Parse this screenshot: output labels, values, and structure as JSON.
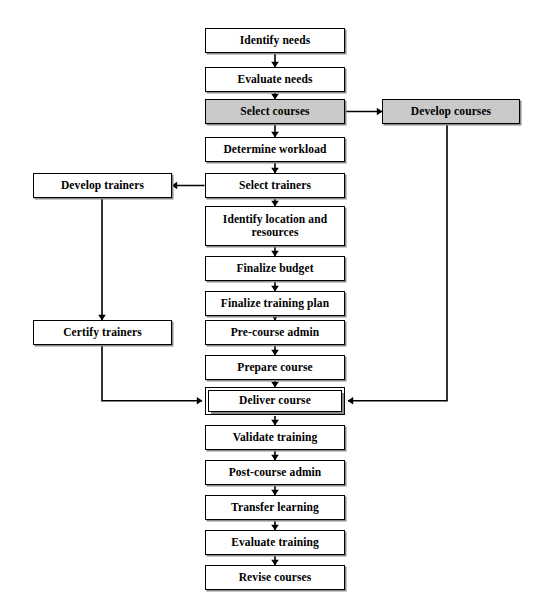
{
  "diagram": {
    "colors": {
      "line": "#000000",
      "node_fill": "#ffffff",
      "shaded_fill": "#c9c9c9",
      "shadow": "#8a8a8a",
      "background": "#ffffff"
    },
    "nodes": [
      {
        "id": "identify-needs",
        "label": "Identify needs",
        "x": 205,
        "y": 28,
        "w": 140,
        "h": 25,
        "style": "plain"
      },
      {
        "id": "evaluate-needs",
        "label": "Evaluate needs",
        "x": 205,
        "y": 67,
        "w": 140,
        "h": 25,
        "style": "plain"
      },
      {
        "id": "select-courses",
        "label": "Select courses",
        "x": 205,
        "y": 99,
        "w": 140,
        "h": 25,
        "style": "shaded"
      },
      {
        "id": "develop-courses",
        "label": "Develop courses",
        "x": 382,
        "y": 99,
        "w": 138,
        "h": 25,
        "style": "shaded"
      },
      {
        "id": "determine-workload",
        "label": "Determine workload",
        "x": 205,
        "y": 137,
        "w": 140,
        "h": 25,
        "style": "plain"
      },
      {
        "id": "select-trainers",
        "label": "Select trainers",
        "x": 205,
        "y": 173,
        "w": 140,
        "h": 25,
        "style": "plain"
      },
      {
        "id": "develop-trainers",
        "label": "Develop trainers",
        "x": 33,
        "y": 173,
        "w": 139,
        "h": 25,
        "style": "plain"
      },
      {
        "id": "identify-location",
        "label": "Identify location and resources",
        "x": 205,
        "y": 206,
        "w": 140,
        "h": 40,
        "style": "plain"
      },
      {
        "id": "finalize-budget",
        "label": "Finalize budget",
        "x": 205,
        "y": 256,
        "w": 140,
        "h": 25,
        "style": "plain"
      },
      {
        "id": "finalize-training-plan",
        "label": "Finalize training plan",
        "x": 205,
        "y": 291,
        "w": 140,
        "h": 25,
        "style": "plain"
      },
      {
        "id": "certify-trainers",
        "label": "Certify trainers",
        "x": 33,
        "y": 320,
        "w": 139,
        "h": 25,
        "style": "plain"
      },
      {
        "id": "pre-course-admin",
        "label": "Pre-course admin",
        "x": 205,
        "y": 320,
        "w": 140,
        "h": 25,
        "style": "plain"
      },
      {
        "id": "prepare-course",
        "label": "Prepare course",
        "x": 205,
        "y": 355,
        "w": 140,
        "h": 25,
        "style": "plain"
      },
      {
        "id": "deliver-course",
        "label": "Deliver course",
        "x": 208,
        "y": 390,
        "w": 134,
        "h": 22,
        "style": "emphasis"
      },
      {
        "id": "validate-training",
        "label": "Validate training",
        "x": 205,
        "y": 425,
        "w": 140,
        "h": 25,
        "style": "plain"
      },
      {
        "id": "post-course-admin",
        "label": "Post-course admin",
        "x": 205,
        "y": 460,
        "w": 140,
        "h": 25,
        "style": "plain"
      },
      {
        "id": "transfer-learning",
        "label": "Transfer learning",
        "x": 205,
        "y": 495,
        "w": 140,
        "h": 25,
        "style": "plain"
      },
      {
        "id": "evaluate-training",
        "label": "Evaluate training",
        "x": 205,
        "y": 530,
        "w": 140,
        "h": 25,
        "style": "plain"
      },
      {
        "id": "revise-courses",
        "label": "Revise courses",
        "x": 205,
        "y": 565,
        "w": 140,
        "h": 25,
        "style": "plain"
      }
    ],
    "connectors": [
      {
        "id": "identify-to-evaluate",
        "from": "identify-needs",
        "to": "evaluate-needs",
        "kind": "vertical-arrow"
      },
      {
        "id": "evaluate-to-select-courses",
        "from": "evaluate-needs",
        "to": "select-courses",
        "kind": "vertical-arrow"
      },
      {
        "id": "select-courses-to-develop",
        "from": "select-courses",
        "to": "develop-courses",
        "kind": "horizontal-arrow-right"
      },
      {
        "id": "select-courses-to-workload",
        "from": "select-courses",
        "to": "determine-workload",
        "kind": "vertical-arrow"
      },
      {
        "id": "workload-to-select-trainers",
        "from": "determine-workload",
        "to": "select-trainers",
        "kind": "vertical-arrow"
      },
      {
        "id": "select-trainers-to-develop",
        "from": "select-trainers",
        "to": "develop-trainers",
        "kind": "horizontal-arrow-left"
      },
      {
        "id": "select-trainers-to-location",
        "from": "select-trainers",
        "to": "identify-location",
        "kind": "vertical-arrow"
      },
      {
        "id": "location-to-budget",
        "from": "identify-location",
        "to": "finalize-budget",
        "kind": "vertical-arrow"
      },
      {
        "id": "budget-to-plan",
        "from": "finalize-budget",
        "to": "finalize-training-plan",
        "kind": "vertical-arrow"
      },
      {
        "id": "plan-to-precourse",
        "from": "finalize-training-plan",
        "to": "pre-course-admin",
        "kind": "vertical-arrow"
      },
      {
        "id": "develop-trainers-to-certify",
        "from": "develop-trainers",
        "to": "certify-trainers",
        "kind": "vertical-arrow"
      },
      {
        "id": "precourse-to-prepare",
        "from": "pre-course-admin",
        "to": "prepare-course",
        "kind": "vertical-arrow"
      },
      {
        "id": "prepare-to-deliver",
        "from": "prepare-course",
        "to": "deliver-course",
        "kind": "vertical-arrow"
      },
      {
        "id": "certify-to-deliver",
        "from": "certify-trainers",
        "to": "deliver-course",
        "kind": "elbow-right"
      },
      {
        "id": "develop-courses-to-deliver",
        "from": "develop-courses",
        "to": "deliver-course",
        "kind": "elbow-left"
      },
      {
        "id": "deliver-to-validate",
        "from": "deliver-course",
        "to": "validate-training",
        "kind": "vertical-arrow"
      },
      {
        "id": "validate-to-postcourse",
        "from": "validate-training",
        "to": "post-course-admin",
        "kind": "vertical-arrow"
      },
      {
        "id": "postcourse-to-transfer",
        "from": "post-course-admin",
        "to": "transfer-learning",
        "kind": "vertical-arrow"
      },
      {
        "id": "transfer-to-evaluate",
        "from": "transfer-learning",
        "to": "evaluate-training",
        "kind": "vertical-arrow"
      },
      {
        "id": "evaluate-to-revise",
        "from": "evaluate-training",
        "to": "revise-courses",
        "kind": "vertical-arrow"
      }
    ]
  }
}
